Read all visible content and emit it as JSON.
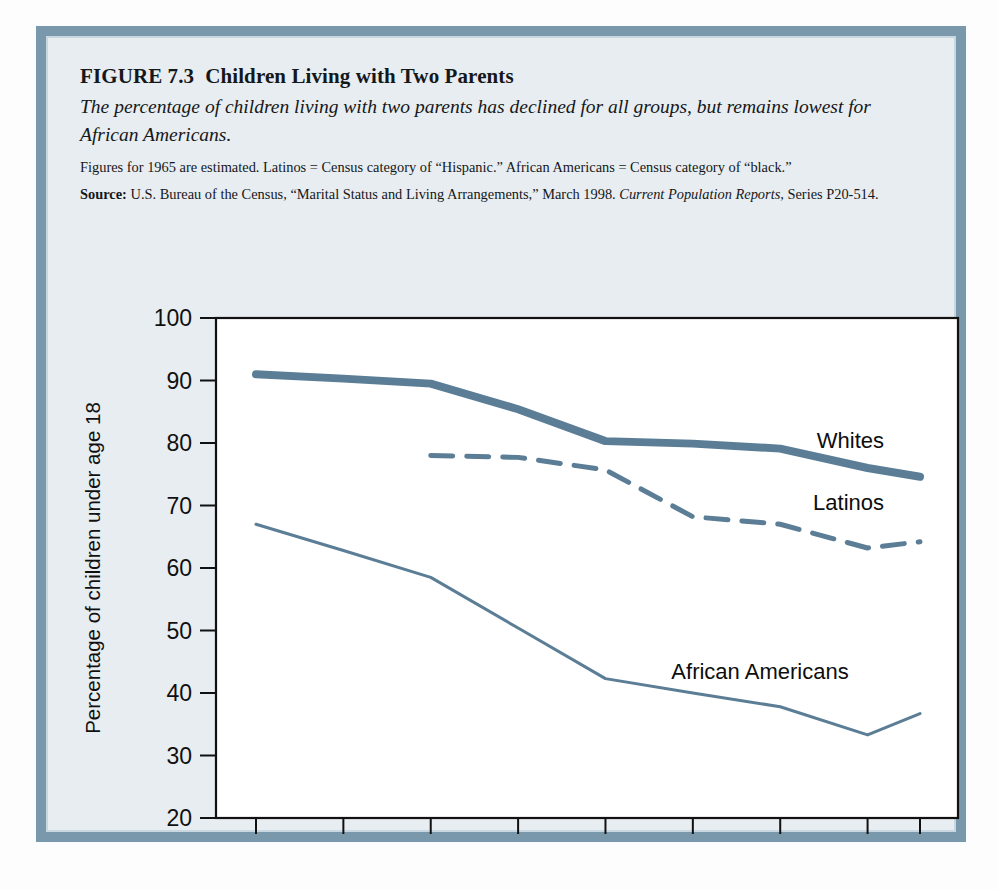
{
  "figure": {
    "number_label": "FIGURE 7.3",
    "title": "Children Living with Two Parents",
    "subtitle": "The percentage of children living with two parents has declined for all groups, but remains lowest for African Americans.",
    "note": "Figures for 1965 are estimated. Latinos = Census category of “Hispanic.” African Americans = Census category of “black.”",
    "source_label": "Source:",
    "source_text_1": " U.S. Bureau of the Census, “Marital Status and Living Arrangements,” March 1998. ",
    "source_italic": "Current Population Reports,",
    "source_text_2": " Series P20-514."
  },
  "colors": {
    "line": "#5b7e96",
    "frame": "#7a98ab",
    "panel": "#e8edf1",
    "plot_background": "#ffffff",
    "axis": "#111111"
  },
  "chart_data": {
    "type": "line",
    "title": "Children Living with Two Parents",
    "xlabel": "",
    "ylabel": "Percentage of children under age 18",
    "categories": [
      "1960",
      "1965",
      "1970",
      "1975",
      "1980",
      "1985",
      "1990",
      "1995",
      "1998"
    ],
    "x": [
      1960,
      1965,
      1970,
      1975,
      1980,
      1985,
      1990,
      1995,
      1998
    ],
    "xlim": [
      1960,
      1998
    ],
    "ylim": [
      20,
      100
    ],
    "yticks": [
      20,
      30,
      40,
      50,
      60,
      70,
      80,
      90,
      100
    ],
    "ytick_labels": [
      "20",
      "30",
      "40",
      "50",
      "60",
      "70",
      "80",
      "90",
      "100"
    ],
    "grid": false,
    "legend_position": "inline-right",
    "series": [
      {
        "name": "Whites",
        "style": "solid-thick",
        "color": "#5b7e96",
        "x": [
          1960,
          1965,
          1970,
          1975,
          1980,
          1985,
          1990,
          1995,
          1998
        ],
        "values": [
          91.0,
          90.3,
          89.5,
          85.4,
          80.3,
          79.9,
          79.1,
          76.0,
          74.6
        ],
        "label_value": 80.5
      },
      {
        "name": "Latinos",
        "style": "dashed",
        "color": "#5b7e96",
        "x": [
          1970,
          1975,
          1980,
          1985,
          1990,
          1995,
          1998
        ],
        "values": [
          78.0,
          77.7,
          75.7,
          68.2,
          67.0,
          63.2,
          64.2
        ],
        "label_value": 70.5
      },
      {
        "name": "African Americans",
        "style": "solid-thin",
        "color": "#5b7e96",
        "x": [
          1960,
          1965,
          1970,
          1975,
          1980,
          1985,
          1990,
          1995,
          1998
        ],
        "values": [
          67.0,
          62.8,
          58.5,
          50.4,
          42.3,
          40.0,
          37.8,
          33.3,
          36.7
        ],
        "label_value": 43.5
      }
    ]
  }
}
